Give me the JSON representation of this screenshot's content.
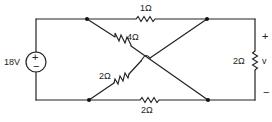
{
  "diagram": {
    "type": "electrical-circuit",
    "source": {
      "label": "18V",
      "plus": "+",
      "minus": "−"
    },
    "resistors": {
      "top": {
        "label": "1Ω"
      },
      "diag_top": {
        "label": "4Ω"
      },
      "diag_bottom": {
        "label": "2Ω"
      },
      "bottom": {
        "label": "2Ω"
      },
      "load": {
        "label": "2Ω"
      }
    },
    "output": {
      "label": "v",
      "plus": "+",
      "minus": "−"
    }
  }
}
